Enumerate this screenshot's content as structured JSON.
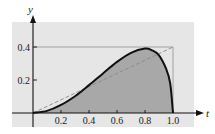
{
  "chart_data": {
    "type": "area",
    "title": "",
    "xlabel": "t",
    "ylabel": "y",
    "xlim": [
      0,
      1.0
    ],
    "ylim": [
      0,
      0.4
    ],
    "x_ticks": [
      "0.2",
      "0.4",
      "0.6",
      "0.8",
      "1.0"
    ],
    "y_ticks": [
      "0.2",
      "0.4"
    ],
    "grid": false,
    "series": [
      {
        "name": "curve (shaded area under)",
        "style": "solid bold, filled gray",
        "x": [
          0,
          0.1,
          0.2,
          0.3,
          0.4,
          0.5,
          0.6,
          0.7,
          0.8,
          0.85,
          0.9,
          0.95,
          0.98,
          1.0
        ],
        "values": [
          0,
          0.013,
          0.049,
          0.102,
          0.169,
          0.24,
          0.31,
          0.365,
          0.39,
          0.38,
          0.35,
          0.27,
          0.18,
          0
        ]
      },
      {
        "name": "line y = 0.4t",
        "style": "dashed",
        "x": [
          0,
          1.0
        ],
        "values": [
          0,
          0.4
        ]
      },
      {
        "name": "bounding rectangle",
        "style": "thin gray",
        "x": [
          0,
          1.0,
          1.0
        ],
        "values": [
          0.4,
          0.4,
          0
        ]
      }
    ]
  },
  "labels": {
    "x_axis": "t",
    "y_axis": "y",
    "x_ticks": [
      "0.2",
      "0.4",
      "0.6",
      "0.8",
      "1.0"
    ],
    "y_ticks": [
      "0.2",
      "0.4"
    ]
  },
  "colors": {
    "background_panel": "#e6e6e6",
    "fill": "#a8a8a8",
    "curve": "#111111",
    "dashed": "#8a8a8a",
    "rect": "#8f8f8f"
  }
}
